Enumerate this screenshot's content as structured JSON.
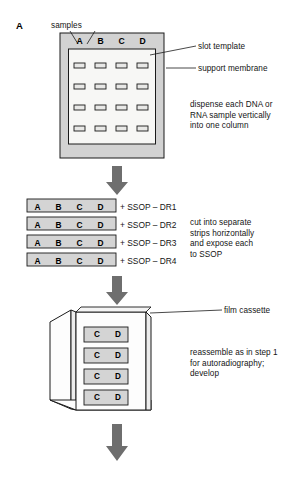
{
  "figure": {
    "panel_label": "A",
    "type": "laboratory-protocol-flow-diagram"
  },
  "colors": {
    "membrane_frame_fill": "#d2d2d2",
    "membrane_inner_fill": "#f7f7f5",
    "slot_fill": "#e8e8e6",
    "strip_fill": "#d4d4d4",
    "cassette_fill": "#fdfdfd",
    "cassette_side_fill": "#ececec",
    "arrow_fill": "#6e6e6e",
    "stroke": "#1a1a1a",
    "text": "#141414"
  },
  "step1": {
    "callouts": {
      "samples": "samples",
      "slot_template": "slot template",
      "support_membrane": "support membrane"
    },
    "instruction": "dispense each DNA or\nRNA sample vertically\ninto one column",
    "columns": [
      "A",
      "B",
      "C",
      "D"
    ],
    "rows": 4,
    "slot_count": 16
  },
  "step2": {
    "instruction": "cut into separate\nstrips horizontally\nand expose each\nto SSOP",
    "strips": [
      {
        "columns": [
          "A",
          "B",
          "C",
          "D"
        ],
        "probe": "+ SSOP – DR1"
      },
      {
        "columns": [
          "A",
          "B",
          "C",
          "D"
        ],
        "probe": "+ SSOP – DR2"
      },
      {
        "columns": [
          "A",
          "B",
          "C",
          "D"
        ],
        "probe": "+ SSOP – DR3"
      },
      {
        "columns": [
          "A",
          "B",
          "C",
          "D"
        ],
        "probe": "+ SSOP – DR4"
      }
    ]
  },
  "step3": {
    "callouts": {
      "film_cassette": "film cassette"
    },
    "instruction": "reassemble as in step 1\nfor autoradiography;\ndevelop",
    "strips": [
      {
        "visible_columns": [
          "C",
          "D"
        ]
      },
      {
        "visible_columns": [
          "C",
          "D"
        ]
      },
      {
        "visible_columns": [
          "C",
          "D"
        ]
      },
      {
        "visible_columns": [
          "C",
          "D"
        ]
      }
    ]
  },
  "arrows": {
    "count": 3,
    "direction": "down",
    "glyph": "down-block-arrow"
  }
}
